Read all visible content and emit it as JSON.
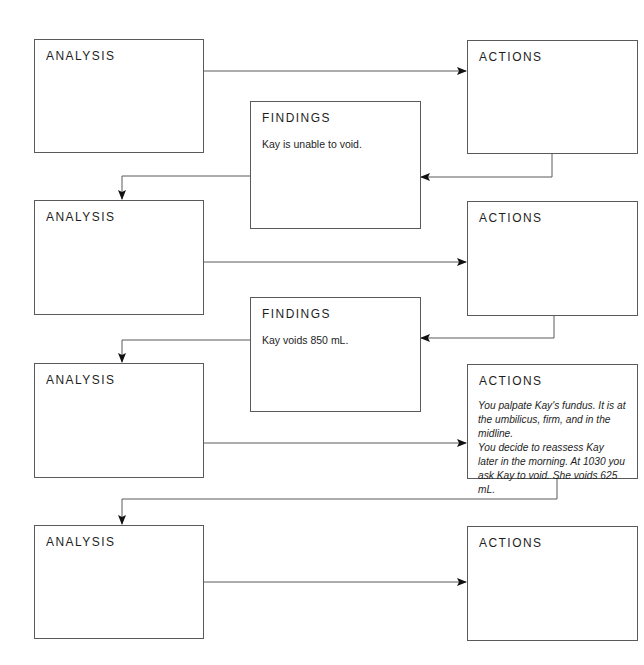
{
  "diagram": {
    "type": "flowchart",
    "rows": [
      {
        "analysis": {
          "title": "ANALYSIS",
          "text": ""
        },
        "actions": {
          "title": "ACTIONS",
          "text": ""
        },
        "findings": {
          "title": "FINDINGS",
          "text": "Kay is unable to void."
        }
      },
      {
        "analysis": {
          "title": "ANALYSIS",
          "text": ""
        },
        "actions": {
          "title": "ACTIONS",
          "text": ""
        },
        "findings": {
          "title": "FINDINGS",
          "text": "Kay voids 850 mL."
        }
      },
      {
        "analysis": {
          "title": "ANALYSIS",
          "text": ""
        },
        "actions": {
          "title": "ACTIONS",
          "text_lines": [
            "You palpate Kay's fundus. It is at",
            "the umbilicus, firm, and in the midline.",
            "You decide to reassess Kay",
            "later in the morning. At 1030 you",
            "ask Kay to void. She voids 625 mL."
          ]
        }
      },
      {
        "analysis": {
          "title": "ANALYSIS",
          "text": ""
        },
        "actions": {
          "title": "ACTIONS",
          "text": ""
        }
      }
    ],
    "colors": {
      "line": "#5a5a5a",
      "arrow": "#111111",
      "text": "#1e1e1e",
      "background": "#ffffff"
    }
  }
}
